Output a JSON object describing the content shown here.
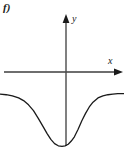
{
  "figure": {
    "label": "f)",
    "background_color": "#ffffff",
    "width": 124,
    "height": 149
  },
  "axes": {
    "x_axis": {
      "label": "x",
      "color": "#6e6e6e",
      "arrow": "right-arrow-icon",
      "y_pixel": 72,
      "x_start_pixel": 4,
      "x_end_pixel": 122
    },
    "y_axis": {
      "label": "y",
      "color": "#4a4a4a",
      "arrow": "up-arrow-icon",
      "x_pixel": 66,
      "y_start_pixel": 16,
      "y_end_pixel": 146
    },
    "origin": {
      "x_pixel": 66,
      "y_pixel": 72
    }
  },
  "curve": {
    "name": "negative-gaussian-curve",
    "color": "#1a1a1a",
    "stroke_width": 1.3,
    "description": "Inverted bell-shaped curve lying below the x-axis, asymptotic to the x-axis on both ends, with a single minimum just left of the y-axis."
  },
  "chart_data": {
    "type": "line",
    "title": "f)",
    "xlabel": "x",
    "ylabel": "y",
    "grid": false,
    "legend": null,
    "axis_arrows": true,
    "xlim": [
      -5.5,
      4.5
    ],
    "ylim": [
      -1.05,
      1.6
    ],
    "annotations": [
      {
        "text": "f)",
        "position": "top-left"
      },
      {
        "text": "y",
        "position": "y-axis-tip"
      },
      {
        "text": "x",
        "position": "x-axis-tip"
      }
    ],
    "series": [
      {
        "name": "curve",
        "x": [
          -5.5,
          -5.0,
          -4.5,
          -4.0,
          -3.6,
          -3.2,
          -2.8,
          -2.4,
          -2.0,
          -1.7,
          -1.4,
          -1.1,
          -0.8,
          -0.5,
          -0.25,
          0.0,
          0.25,
          0.5,
          0.8,
          1.1,
          1.4,
          1.7,
          2.0,
          2.4,
          2.8,
          3.2,
          3.6,
          4.0,
          4.5
        ],
        "y": [
          -0.02,
          -0.03,
          -0.05,
          -0.09,
          -0.14,
          -0.22,
          -0.33,
          -0.48,
          -0.64,
          -0.76,
          -0.87,
          -0.95,
          -0.99,
          -1.0,
          -0.99,
          -0.96,
          -0.9,
          -0.82,
          -0.68,
          -0.52,
          -0.38,
          -0.26,
          -0.17,
          -0.09,
          -0.05,
          -0.03,
          -0.02,
          -0.01,
          -0.01
        ]
      }
    ]
  }
}
